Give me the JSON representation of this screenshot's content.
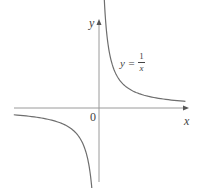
{
  "chart_data": {
    "type": "line",
    "title": "",
    "function": "y = 1/x",
    "xlabel": "x",
    "ylabel": "y",
    "origin_label": "0",
    "annotations": [
      {
        "text": "y = 1/x",
        "numerator": "1",
        "denominator": "x"
      }
    ],
    "grid": false,
    "legend": null,
    "series": [
      {
        "name": "y = 1/x (x > 0)",
        "x": [
          0.1,
          0.2,
          0.5,
          1,
          2,
          3,
          4
        ],
        "y": [
          10,
          5,
          2,
          1,
          0.5,
          0.333,
          0.25
        ]
      },
      {
        "name": "y = 1/x (x < 0)",
        "x": [
          -4,
          -3,
          -2,
          -1,
          -0.5,
          -0.2,
          -0.1
        ],
        "y": [
          -0.25,
          -0.333,
          -0.5,
          -1,
          -2,
          -5,
          -10
        ]
      }
    ],
    "colors": {
      "axis": "#9a9a9a",
      "curve": "#6e6e6e",
      "text": "#444444"
    }
  },
  "labels": {
    "y_axis": "y",
    "x_axis": "x",
    "origin": "0",
    "eq_lhs": "y =",
    "eq_num": "1",
    "eq_den": "x"
  }
}
